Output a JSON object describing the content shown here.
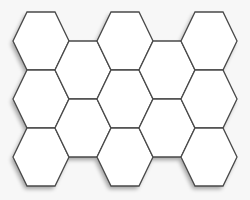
{
  "diagram": {
    "type": "hexagonal-tile-pattern",
    "colors": {
      "background": "#f7f7f7",
      "hex_fill": "#ffffff",
      "hex_stroke": "#4a4a4a",
      "shadow": "#000000"
    },
    "hex": {
      "radius": 28,
      "height": 58
    },
    "columns": [
      {
        "cx": 41,
        "rows": [
          41,
          99,
          157
        ]
      },
      {
        "cx": 83,
        "rows": [
          70,
          128
        ]
      },
      {
        "cx": 125,
        "rows": [
          41,
          99,
          157
        ]
      },
      {
        "cx": 167,
        "rows": [
          70,
          128
        ]
      },
      {
        "cx": 209,
        "rows": [
          41,
          99,
          157
        ]
      }
    ],
    "hex_count": 13
  }
}
